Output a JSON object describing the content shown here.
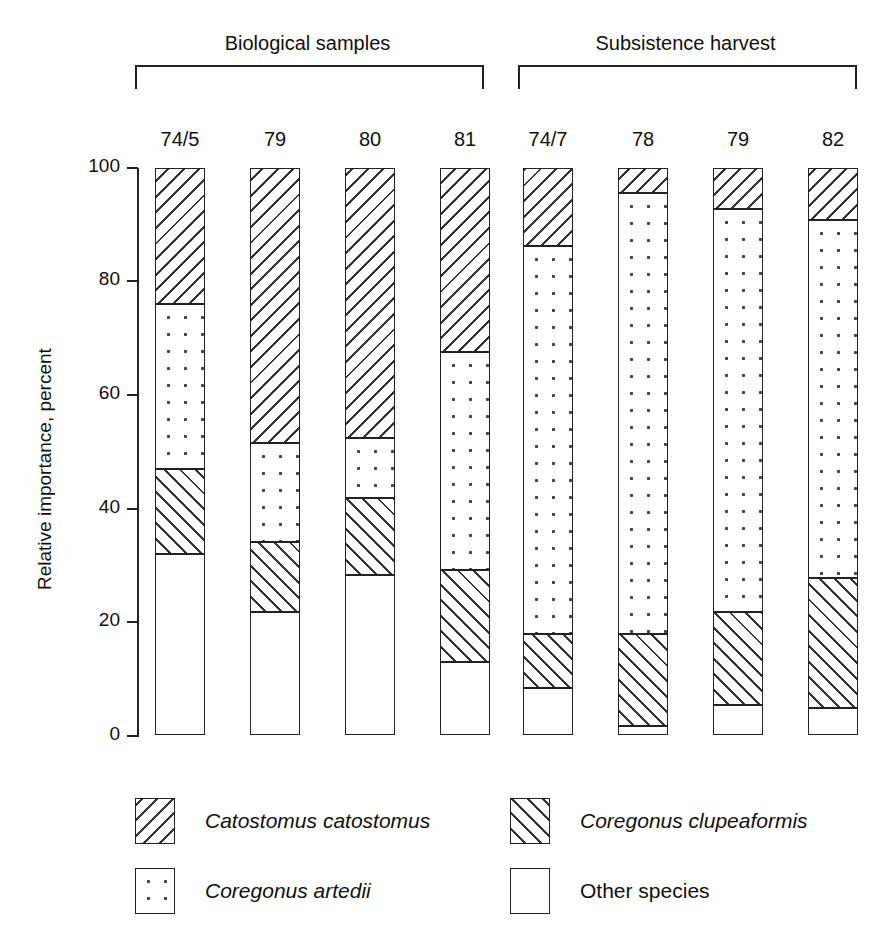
{
  "chart_data": {
    "type": "bar",
    "subtype": "stacked-bar-100-percent",
    "title": "",
    "xlabel": "",
    "ylabel": "Relative importance, percent",
    "ylim": [
      0,
      100
    ],
    "yticks": [
      0,
      20,
      40,
      60,
      80,
      100
    ],
    "ytick_labels": [
      "0",
      "20",
      "40",
      "60",
      "80",
      "100"
    ],
    "grid": false,
    "legend_position": "bottom",
    "stack_order_bottom_to_top": [
      "Other species",
      "Coregonus clupeaformis",
      "Coregonus artedii",
      "Catostomus catostomus"
    ],
    "groups": [
      {
        "name": "Biological samples",
        "categories": [
          "74/5",
          "79",
          "80",
          "81"
        ]
      },
      {
        "name": "Subsistence harvest",
        "categories": [
          "74/7",
          "78",
          "79",
          "82"
        ]
      }
    ],
    "categories": [
      "74/5",
      "79",
      "80",
      "81",
      "74/7",
      "78",
      "79",
      "82"
    ],
    "series": [
      {
        "name": "Other species",
        "pattern": "blank",
        "values": [
          32.0,
          21.7,
          28.2,
          12.9,
          8.3,
          1.6,
          5.3,
          4.8
        ]
      },
      {
        "name": "Coregonus clupeaformis",
        "pattern": "bslash",
        "values": [
          15.0,
          12.3,
          13.6,
          16.2,
          9.5,
          16.2,
          16.4,
          22.9
        ]
      },
      {
        "name": "Coregonus artedii",
        "pattern": "dots",
        "values": [
          29.0,
          17.5,
          10.6,
          38.4,
          68.4,
          77.8,
          71.1,
          63.1
        ]
      },
      {
        "name": "Catostomus catostomus",
        "pattern": "fslash",
        "values": [
          24.0,
          48.5,
          47.6,
          32.5,
          13.8,
          4.4,
          7.2,
          9.2
        ]
      }
    ],
    "legend": [
      {
        "label": "Catostomus catostomus",
        "pattern": "fslash",
        "italic": true
      },
      {
        "label": "Coregonus clupeaformis",
        "pattern": "bslash",
        "italic": true
      },
      {
        "label": "Coregonus artedii",
        "pattern": "dots",
        "italic": true
      },
      {
        "label": "Other species",
        "pattern": "blank",
        "italic": false
      }
    ]
  }
}
